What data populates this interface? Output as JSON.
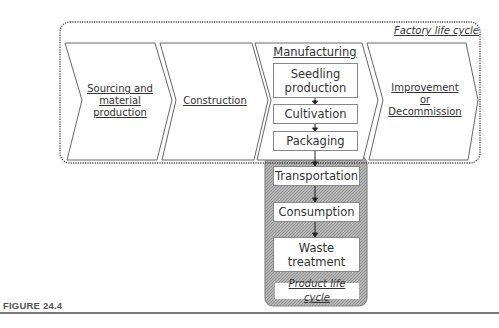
{
  "factory_cycle": {
    "label": "Factory life cycle",
    "stages": [
      {
        "id": "sourcing",
        "label": "Sourcing and material production"
      },
      {
        "id": "construction",
        "label": "Construction"
      },
      {
        "id": "manufacturing",
        "label": "Manufacturing"
      },
      {
        "id": "improvement",
        "label": "Improvement or Decommission"
      }
    ]
  },
  "manufacturing_steps": [
    {
      "label": "Seedling production"
    },
    {
      "label": "Cultivation"
    },
    {
      "label": "Packaging"
    }
  ],
  "product_cycle": {
    "label": "Product life cycle",
    "steps": [
      {
        "label": "Transportation"
      },
      {
        "label": "Consumption"
      },
      {
        "label": "Waste treatment"
      }
    ]
  },
  "caption": "FIGURE 24.4",
  "colors": {
    "product_box_fill": "#a9a9a9",
    "outline": "#666666",
    "dotted_border": "#444444"
  }
}
